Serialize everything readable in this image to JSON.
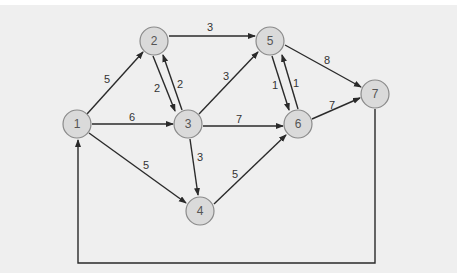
{
  "diagram": {
    "type": "directed-weighted-graph",
    "colors": {
      "background": "#efefef",
      "node_fill": "#dadada",
      "node_stroke": "#8a8a8a",
      "edge": "#2a2a2a"
    },
    "nodes": [
      {
        "id": "1",
        "label": "1",
        "x": 77,
        "y": 124
      },
      {
        "id": "2",
        "label": "2",
        "x": 154,
        "y": 41
      },
      {
        "id": "3",
        "label": "3",
        "x": 188,
        "y": 124
      },
      {
        "id": "4",
        "label": "4",
        "x": 200,
        "y": 211
      },
      {
        "id": "5",
        "label": "5",
        "x": 270,
        "y": 41
      },
      {
        "id": "6",
        "label": "6",
        "x": 298,
        "y": 124
      },
      {
        "id": "7",
        "label": "7",
        "x": 375,
        "y": 94
      }
    ],
    "edges": [
      {
        "from": "1",
        "to": "2",
        "weight": "5"
      },
      {
        "from": "1",
        "to": "3",
        "weight": "6"
      },
      {
        "from": "1",
        "to": "4",
        "weight": "5"
      },
      {
        "from": "2",
        "to": "5",
        "weight": "3"
      },
      {
        "from": "2",
        "to": "3",
        "weight": "2"
      },
      {
        "from": "3",
        "to": "2",
        "weight": "2"
      },
      {
        "from": "3",
        "to": "5",
        "weight": "3"
      },
      {
        "from": "3",
        "to": "6",
        "weight": "7"
      },
      {
        "from": "3",
        "to": "4",
        "weight": "3"
      },
      {
        "from": "4",
        "to": "6",
        "weight": "5"
      },
      {
        "from": "5",
        "to": "6",
        "weight": "1"
      },
      {
        "from": "6",
        "to": "5",
        "weight": "1"
      },
      {
        "from": "5",
        "to": "7",
        "weight": "8"
      },
      {
        "from": "6",
        "to": "7",
        "weight": "7"
      },
      {
        "from": "7",
        "to": "1",
        "weight": ""
      }
    ]
  }
}
